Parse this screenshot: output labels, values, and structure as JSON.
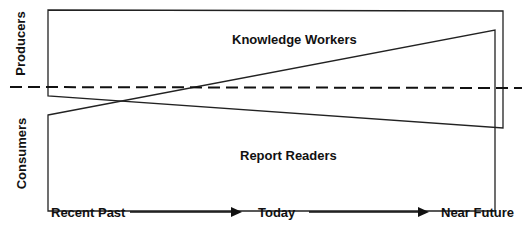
{
  "diagram": {
    "axis_labels": {
      "top": "Producers",
      "bottom": "Consumers"
    },
    "regions": {
      "top": "Knowledge Workers",
      "bottom": "Report Readers"
    },
    "timeline": [
      "Recent Past",
      "Today",
      "Near Future"
    ],
    "colors": {
      "line": "#222222",
      "background": "#ffffff"
    }
  }
}
